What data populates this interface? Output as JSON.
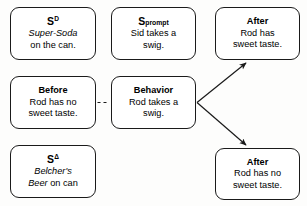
{
  "diagram": {
    "type": "abc-contingency-diagram",
    "background_color": "#fdfdfc",
    "box_border_color": "#1a1a1a",
    "box_fill_color": "#ffffff",
    "connector_color": "#1a1a1a",
    "boxes": [
      {
        "id": "sd",
        "symbol_base": "S",
        "symbol_superscript": "D",
        "line1": "Super-Soda",
        "line1_style": "italic",
        "line2": "on the can.",
        "line2_style": "regular",
        "column": 1,
        "row": 1
      },
      {
        "id": "sprompt",
        "symbol_base": "S",
        "symbol_superscript": "prompt",
        "line1": "Sid takes a",
        "line1_style": "regular",
        "line2": "swig.",
        "line2_style": "regular",
        "column": 2,
        "row": 1
      },
      {
        "id": "after-top",
        "heading": "After",
        "line1": "Rod has",
        "line2": "sweet taste.",
        "column": 3,
        "row": 1
      },
      {
        "id": "before",
        "heading": "Before",
        "line1": "Rod has no",
        "line2": "sweet taste.",
        "column": 1,
        "row": 2
      },
      {
        "id": "behavior",
        "heading": "Behavior",
        "line1": "Rod takes a",
        "line2": "swig.",
        "column": 2,
        "row": 2
      },
      {
        "id": "sdelta",
        "symbol_base": "S",
        "symbol_superscript": "Δ",
        "line1": "Belcher's",
        "line1_style": "italic",
        "line2_italic": "Beer",
        "line2_regular": " on can",
        "column": 1,
        "row": 3
      },
      {
        "id": "after-bottom",
        "heading": "After",
        "line1": "Rod has no",
        "line2": "sweet taste.",
        "column": 3,
        "row": 3
      }
    ],
    "connectors": [
      {
        "id": "before-to-behavior",
        "style": "dashed",
        "arrowhead": false,
        "from": "before",
        "to": "behavior"
      },
      {
        "id": "behavior-to-after-top",
        "style": "solid",
        "arrowhead": true,
        "from": "behavior",
        "to": "after-top"
      },
      {
        "id": "behavior-to-after-bottom",
        "style": "solid",
        "arrowhead": true,
        "from": "behavior",
        "to": "after-bottom"
      }
    ]
  }
}
